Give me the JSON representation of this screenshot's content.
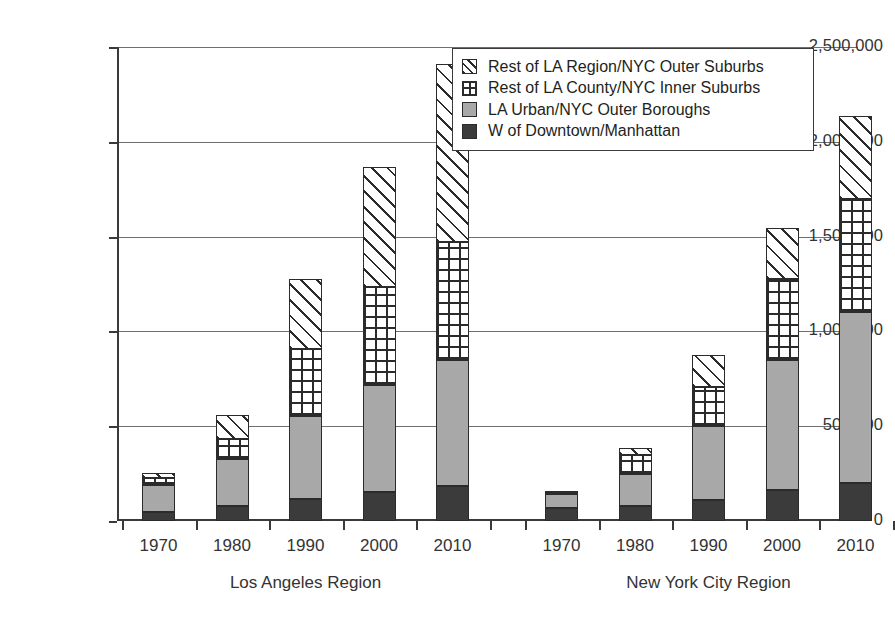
{
  "chart_data": {
    "type": "bar",
    "subtype": "stacked-bar-grouped",
    "title": "",
    "xlabel": "",
    "ylabel": "",
    "ylim": [
      0,
      2500000
    ],
    "ytick_values": [
      0,
      500000,
      1000000,
      1500000,
      2000000,
      2500000
    ],
    "ytick_labels": [
      "0",
      "500,000",
      "1,000,000",
      "1,500,000",
      "2,000,000",
      "2,500,000"
    ],
    "grid": true,
    "grid_axis": "y",
    "legend_position": "top-right",
    "groups": [
      {
        "name": "Los Angeles Region",
        "categories": [
          "1970",
          "1980",
          "1990",
          "2000",
          "2010"
        ]
      },
      {
        "name": "New York City Region",
        "categories": [
          "1970",
          "1980",
          "1990",
          "2000",
          "2010"
        ]
      }
    ],
    "categories": [
      "1970",
      "1980",
      "1990",
      "2000",
      "2010",
      "1970",
      "1980",
      "1990",
      "2000",
      "2010"
    ],
    "series": [
      {
        "name": "W of Downtown/Manhattan",
        "fill": "solid-dark",
        "color": "#3b3b3b",
        "values": [
          45000,
          80000,
          115000,
          155000,
          185000,
          70000,
          80000,
          110000,
          165000,
          200000
        ]
      },
      {
        "name": "LA Urban/NYC Outer Boroughs",
        "fill": "solid-gray",
        "color": "#a8a8a8",
        "values": [
          145000,
          245000,
          440000,
          560000,
          665000,
          70000,
          170000,
          390000,
          685000,
          905000
        ]
      },
      {
        "name": "Rest of LA County/NYC Inner Suburbs",
        "fill": "grid-hatch",
        "color": "#ffffff",
        "values": [
          35000,
          105000,
          350000,
          520000,
          620000,
          20000,
          100000,
          205000,
          425000,
          595000
        ]
      },
      {
        "name": "Rest of LA Region/NYC Outer Suburbs",
        "fill": "diag-hatch",
        "color": "#ffffff",
        "values": [
          30000,
          130000,
          370000,
          630000,
          940000,
          0,
          35000,
          170000,
          270000,
          435000
        ]
      }
    ],
    "totals": [
      255000,
      560000,
      1275000,
      1865000,
      2410000,
      160000,
      385000,
      875000,
      1545000,
      2135000
    ],
    "cumulative_tops": {
      "W of Downtown/Manhattan": [
        45000,
        80000,
        115000,
        155000,
        185000,
        70000,
        80000,
        110000,
        165000,
        200000
      ],
      "LA Urban/NYC Outer Boroughs": [
        190000,
        325000,
        555000,
        715000,
        850000,
        140000,
        250000,
        500000,
        850000,
        1105000
      ],
      "Rest of LA County/NYC Inner Suburbs": [
        225000,
        430000,
        905000,
        1235000,
        1470000,
        160000,
        350000,
        705000,
        1275000,
        1700000
      ],
      "Rest of LA Region/NYC Outer Suburbs": [
        255000,
        560000,
        1275000,
        1865000,
        2410000,
        160000,
        385000,
        875000,
        1545000,
        2135000
      ]
    }
  },
  "legend": {
    "items": [
      {
        "label": "Rest of LA Region/NYC Outer Suburbs",
        "swatch": "diagonal-hatch-swatch"
      },
      {
        "label": "Rest of LA County/NYC Inner Suburbs",
        "swatch": "grid-hatch-swatch"
      },
      {
        "label": "LA Urban/NYC Outer Boroughs",
        "swatch": "solid-gray-swatch"
      },
      {
        "label": "W of Downtown/Manhattan",
        "swatch": "solid-dark-swatch"
      }
    ]
  },
  "axis": {
    "y_labels": [
      "2,500,000",
      "2,000,000",
      "1,500,000",
      "1,000,000",
      "500,000",
      "0"
    ],
    "x_labels": [
      "1970",
      "1980",
      "1990",
      "2000",
      "2010",
      "1970",
      "1980",
      "1990",
      "2000",
      "2010"
    ],
    "group_labels": [
      "Los Angeles Region",
      "New York City Region"
    ]
  },
  "colors": {
    "axis": "#3a3a3a",
    "grid": "#6f6f6f",
    "dark_segment": "#3b3b3b",
    "gray_segment": "#a8a8a8",
    "hatch_stroke": "#2b2b2b",
    "background": "#ffffff",
    "text": "#231f20"
  }
}
